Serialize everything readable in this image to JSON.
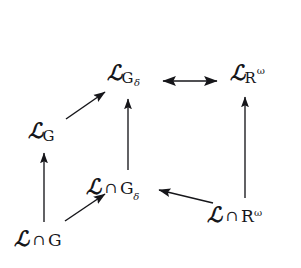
{
  "figure": {
    "type": "commutative-diagram",
    "background_color": "#ffffff",
    "ink_color": "#16161a",
    "width": 301,
    "height": 268
  },
  "nodes": {
    "l_gdelta": {
      "id": "L_Gdelta",
      "plain": "L_{G_delta}",
      "base": "ℒ",
      "subscript": "G",
      "sub_subscript": "δ",
      "x": 107,
      "y": 62
    },
    "l_romega": {
      "id": "L_Romega",
      "plain": "L_{R^omega}",
      "base": "ℒ",
      "subscript": "R",
      "superscript": "ω",
      "x": 230,
      "y": 62
    },
    "l_g": {
      "id": "L_G",
      "plain": "L_G",
      "base": "ℒ",
      "subscript": "G",
      "x": 28,
      "y": 120
    },
    "l_cap_gdelta": {
      "id": "L_cap_Gdelta",
      "plain": "L ∩ G_delta",
      "base": "ℒ",
      "operator": "∩",
      "right": "G",
      "right_subscript": "δ",
      "x": 86,
      "y": 176
    },
    "l_cap_romega": {
      "id": "L_cap_Romega",
      "plain": "L ∩ R^omega",
      "base": "ℒ",
      "operator": "∩",
      "right": "R",
      "right_superscript": "ω",
      "x": 207,
      "y": 204
    },
    "l_cap_g": {
      "id": "L_cap_G",
      "plain": "L ∩ G",
      "base": "ℒ",
      "operator": "∩",
      "right": "G",
      "x": 14,
      "y": 228
    }
  },
  "arrows": [
    {
      "name": "arrow-lgdelta-to-lromega",
      "from": "L_Gdelta",
      "to": "L_Romega",
      "heads": "both",
      "orientation": "horizontal",
      "x1": 162,
      "y1": 81,
      "x2": 218,
      "y2": 81
    },
    {
      "name": "arrow-lcapgdelta-to-lgdelta",
      "from": "L_cap_Gdelta",
      "to": "L_Gdelta",
      "heads": "end",
      "orientation": "vertical",
      "x1": 128,
      "y1": 170,
      "x2": 128,
      "y2": 98
    },
    {
      "name": "arrow-lcapromega-to-lromega",
      "from": "L_cap_Romega",
      "to": "L_Romega",
      "heads": "end",
      "orientation": "vertical",
      "x1": 245,
      "y1": 198,
      "x2": 245,
      "y2": 96
    },
    {
      "name": "arrow-lcapg-to-lg",
      "from": "L_cap_G",
      "to": "L_G",
      "heads": "end",
      "orientation": "vertical",
      "x1": 44,
      "y1": 222,
      "x2": 44,
      "y2": 152
    },
    {
      "name": "arrow-lg-to-lgdelta",
      "from": "L_G",
      "to": "L_Gdelta",
      "heads": "end",
      "orientation": "diagonal-up-right",
      "x1": 66,
      "y1": 119,
      "x2": 105,
      "y2": 92
    },
    {
      "name": "arrow-lcapg-to-lcapgdelta",
      "from": "L_cap_G",
      "to": "L_cap_Gdelta",
      "heads": "end",
      "orientation": "diagonal-up-right",
      "x1": 65,
      "y1": 221,
      "x2": 106,
      "y2": 194
    },
    {
      "name": "arrow-lcapromega-to-lcapgdelta",
      "from": "L_cap_Romega",
      "to": "L_cap_Gdelta",
      "heads": "end",
      "orientation": "diagonal-up-left",
      "x1": 212,
      "y1": 203,
      "x2": 158,
      "y2": 190
    }
  ]
}
